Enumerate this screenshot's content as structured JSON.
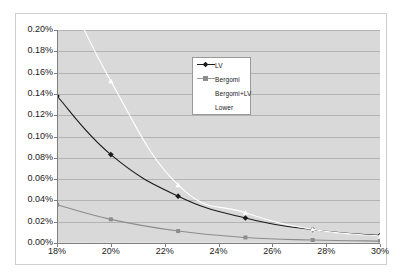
{
  "chart_data": {
    "type": "line",
    "title": "",
    "xlabel": "",
    "ylabel": "",
    "xlim": [
      18,
      30
    ],
    "ylim": [
      0.0,
      0.2
    ],
    "grid": true,
    "legend_position": "inside-top-center",
    "y_ticks": [
      "0.20%",
      "0.18%",
      "0.16%",
      "0.14%",
      "0.12%",
      "0.10%",
      "0.08%",
      "0.06%",
      "0.04%",
      "0.02%",
      "0.00%"
    ],
    "y_tick_values": [
      0.2,
      0.18,
      0.16,
      0.14,
      0.12,
      0.1,
      0.08,
      0.06,
      0.04,
      0.02,
      0.0
    ],
    "x_ticks": [
      "18%",
      "20%",
      "22%",
      "24%",
      "26%",
      "28%",
      "30%"
    ],
    "x_tick_values": [
      18,
      20,
      22,
      24,
      26,
      28,
      30
    ],
    "series": [
      {
        "name": "LV",
        "color": "#1a1a1a",
        "marker": "diamond",
        "marker_color": "#1a1a1a",
        "x": [
          18,
          20,
          22.5,
          25,
          27.5,
          30
        ],
        "values": [
          0.138,
          0.083,
          0.044,
          0.0235,
          0.0125,
          0.007
        ]
      },
      {
        "name": "Bergomi",
        "color": "#8c8c8c",
        "marker": "square",
        "marker_color": "#8c8c8c",
        "x": [
          18,
          20,
          22.5,
          25,
          27.5,
          30
        ],
        "values": [
          0.036,
          0.0222,
          0.0112,
          0.0052,
          0.0028,
          0.0018
        ]
      },
      {
        "name": "Bergomi+LV",
        "color": "#ffffff",
        "marker": "triangle",
        "marker_color": "#ffffff",
        "x": [
          18,
          20,
          22.5,
          25,
          27.5,
          30
        ],
        "values": [
          0.255,
          0.152,
          0.0545,
          0.0285,
          0.0128,
          0.0065
        ]
      },
      {
        "name": "Lower",
        "color": "#e8e8e8",
        "marker": "none",
        "marker_color": "#e8e8e8",
        "x": [
          18,
          30
        ],
        "values": [
          0.0,
          0.0
        ]
      }
    ]
  },
  "legend": {
    "entries": [
      {
        "label": "LV"
      },
      {
        "label": "Bergomi"
      },
      {
        "label": "Bergomi+LV"
      },
      {
        "label": "Lower"
      }
    ]
  },
  "colors": {
    "plot_background": "#d9d9d9",
    "frame_background": "#ffffff",
    "gridline": "#b3b3b3",
    "axis": "#808080",
    "text": "#1a1a1a"
  }
}
